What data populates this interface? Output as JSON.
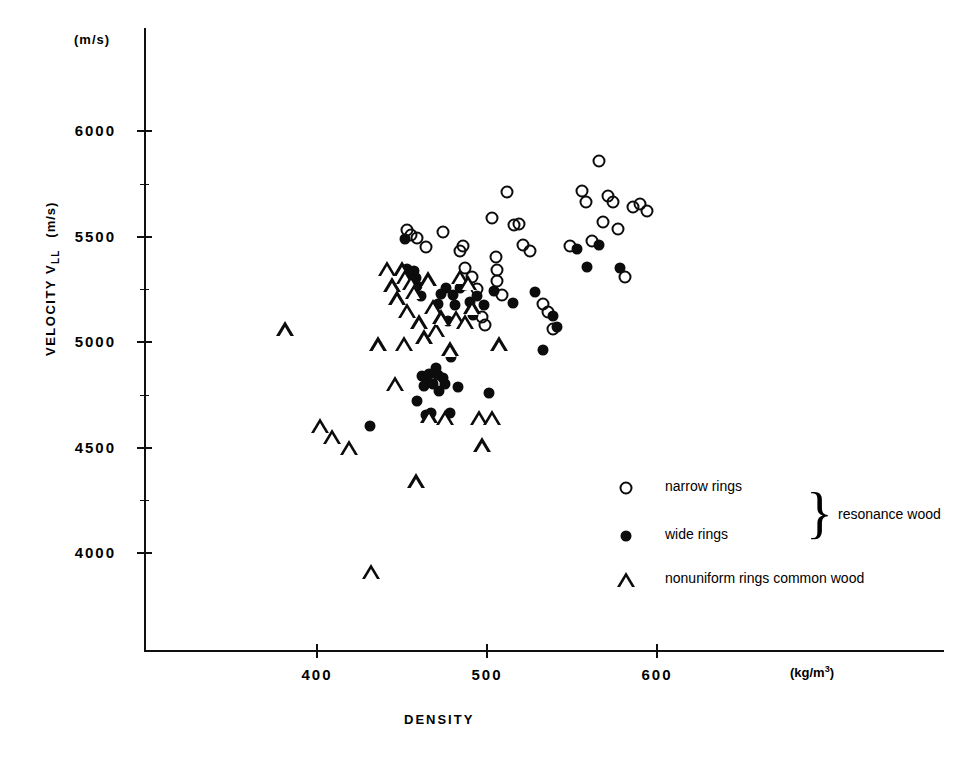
{
  "chart_data": {
    "type": "scatter",
    "title": "",
    "xlabel": "DENSITY",
    "xunit": "(kg/m",
    "xunit_sup": "3",
    "xunit_close": ")",
    "ylabel": "VELOCITY V",
    "ylabel_sub": "LL",
    "ylabel_unit": "(m/s)",
    "yunit_top": "(m/s)",
    "xlim": [
      345,
      815
    ],
    "ylim": [
      3700,
      6150
    ],
    "grid": false,
    "legend_position": "inside-lower-right",
    "xticks": [
      400,
      500,
      600
    ],
    "xticklabels": [
      "400",
      "500",
      "600"
    ],
    "yticks": [
      4000,
      4500,
      5000,
      5500,
      6000
    ],
    "yticklabels": [
      "4000",
      "4500",
      "5000",
      "5500",
      "6000"
    ],
    "yminorticks": [
      4250,
      4750,
      5250,
      5750
    ],
    "series": [
      {
        "name": "narrow rings",
        "marker": "open-circle",
        "group": "resonance wood",
        "points": [
          [
            453,
            5530
          ],
          [
            455,
            5508
          ],
          [
            459,
            5492
          ],
          [
            464,
            5449
          ],
          [
            474,
            5521
          ],
          [
            484,
            5432
          ],
          [
            486,
            5456
          ],
          [
            487,
            5352
          ],
          [
            491,
            5309
          ],
          [
            494,
            5250
          ],
          [
            497,
            5118
          ],
          [
            499,
            5082
          ],
          [
            503,
            5588
          ],
          [
            505,
            5404
          ],
          [
            506,
            5343
          ],
          [
            506,
            5290
          ],
          [
            509,
            5221
          ],
          [
            512,
            5710
          ],
          [
            516,
            5554
          ],
          [
            519,
            5558
          ],
          [
            521,
            5462
          ],
          [
            525,
            5430
          ],
          [
            533,
            5182
          ],
          [
            536,
            5140
          ],
          [
            539,
            5061
          ],
          [
            549,
            5455
          ],
          [
            556,
            5716
          ],
          [
            558,
            5665
          ],
          [
            562,
            5480
          ],
          [
            566,
            5857
          ],
          [
            568,
            5570
          ],
          [
            571,
            5692
          ],
          [
            574,
            5664
          ],
          [
            577,
            5536
          ],
          [
            581,
            5310
          ],
          [
            586,
            5640
          ],
          [
            590,
            5654
          ],
          [
            594,
            5620
          ]
        ]
      },
      {
        "name": "wide rings",
        "marker": "filled-circle",
        "group": "resonance wood",
        "points": [
          [
            431,
            4600
          ],
          [
            452,
            5490
          ],
          [
            453,
            5345
          ],
          [
            455,
            5332
          ],
          [
            457,
            5338
          ],
          [
            458,
            5304
          ],
          [
            459,
            5264
          ],
          [
            459,
            4720
          ],
          [
            461,
            5218
          ],
          [
            462,
            4840
          ],
          [
            463,
            4790
          ],
          [
            464,
            4835
          ],
          [
            464,
            4655
          ],
          [
            466,
            4848
          ],
          [
            467,
            4663
          ],
          [
            468,
            4800
          ],
          [
            469,
            4852
          ],
          [
            470,
            4876
          ],
          [
            471,
            4845
          ],
          [
            471,
            5180
          ],
          [
            472,
            4770
          ],
          [
            473,
            5228
          ],
          [
            474,
            4830
          ],
          [
            475,
            4800
          ],
          [
            476,
            5258
          ],
          [
            477,
            5100
          ],
          [
            478,
            4663
          ],
          [
            479,
            4930
          ],
          [
            480,
            5222
          ],
          [
            481,
            5177
          ],
          [
            483,
            4789
          ],
          [
            484,
            5255
          ],
          [
            487,
            5272
          ],
          [
            490,
            5190
          ],
          [
            492,
            5127
          ],
          [
            494,
            5220
          ],
          [
            498,
            5175
          ],
          [
            501,
            4760
          ],
          [
            504,
            5240
          ],
          [
            515,
            5186
          ],
          [
            528,
            5238
          ],
          [
            533,
            4960
          ],
          [
            539,
            5122
          ],
          [
            541,
            5070
          ],
          [
            553,
            5442
          ],
          [
            559,
            5354
          ],
          [
            566,
            5460
          ],
          [
            578,
            5350
          ]
        ]
      },
      {
        "name": "nonuniform rings common wood",
        "marker": "triangle",
        "group": "common wood",
        "points": [
          [
            381,
            5060
          ],
          [
            402,
            4604
          ],
          [
            409,
            4550
          ],
          [
            419,
            4498
          ],
          [
            432,
            3910
          ],
          [
            436,
            4990
          ],
          [
            441,
            5348
          ],
          [
            444,
            5268
          ],
          [
            446,
            4803
          ],
          [
            447,
            5208
          ],
          [
            450,
            5345
          ],
          [
            451,
            4992
          ],
          [
            452,
            5310
          ],
          [
            453,
            5148
          ],
          [
            455,
            5280
          ],
          [
            457,
            5238
          ],
          [
            458,
            4340
          ],
          [
            460,
            5094
          ],
          [
            463,
            5022
          ],
          [
            465,
            5298
          ],
          [
            466,
            4648
          ],
          [
            468,
            5168
          ],
          [
            470,
            5058
          ],
          [
            473,
            5118
          ],
          [
            475,
            4640
          ],
          [
            478,
            4966
          ],
          [
            482,
            5114
          ],
          [
            484,
            5310
          ],
          [
            487,
            5096
          ],
          [
            489,
            5280
          ],
          [
            491,
            5164
          ],
          [
            495,
            4642
          ],
          [
            497,
            4510
          ],
          [
            503,
            4640
          ],
          [
            507,
            4990
          ]
        ]
      }
    ],
    "legend": [
      {
        "label": "narrow rings",
        "marker": "open-circle"
      },
      {
        "label": "wide rings",
        "marker": "filled-circle"
      },
      {
        "label": "nonuniform rings common wood",
        "marker": "triangle"
      }
    ],
    "brace_label": "resonance wood",
    "brace_glyph": "}"
  }
}
